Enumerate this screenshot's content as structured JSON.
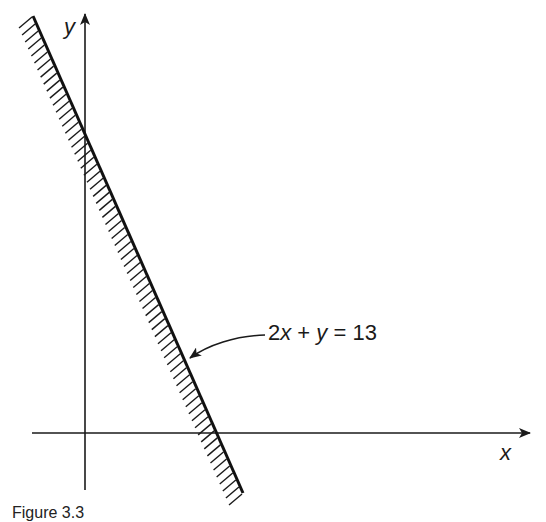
{
  "figure": {
    "axes": {
      "x_label": "x",
      "y_label": "y"
    },
    "line": {
      "equation": "2x + y = 13",
      "label_parts": [
        "2",
        "x",
        " + ",
        "y",
        " = 13"
      ],
      "shaded_side": "left/below"
    },
    "caption": "Figure 3.3"
  },
  "chart_data": {
    "type": "line",
    "title": "",
    "xlabel": "x",
    "ylabel": "y",
    "series": [
      {
        "name": "2x + y = 13",
        "x": [
          0,
          6.5
        ],
        "y": [
          13,
          0
        ]
      }
    ],
    "annotations": [
      "2x + y = 13",
      "hatched side indicates feasible region 2x + y <= 13"
    ],
    "grid": false
  }
}
